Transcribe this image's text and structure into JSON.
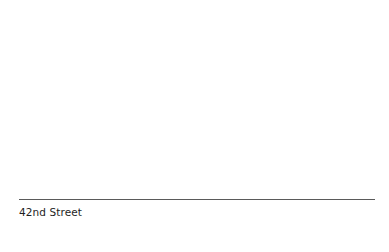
{
  "caption": {
    "text": "42nd Street"
  },
  "colors": {
    "background": "#ffffff",
    "divider": "#5a5a5a",
    "text": "#1e1e1e"
  }
}
